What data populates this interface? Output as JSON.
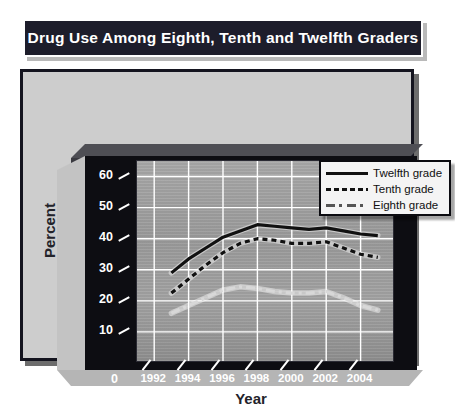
{
  "title": "Drug Use Among Eighth, Tenth and Twelfth Graders",
  "axis": {
    "ylabel": "Percent",
    "xlabel": "Year",
    "yticks": [
      "60",
      "50",
      "40",
      "30",
      "20",
      "10"
    ],
    "yzero": "0",
    "xticks": [
      "1992",
      "1994",
      "1996",
      "1998",
      "2000",
      "2002",
      "2004"
    ]
  },
  "legend": {
    "items": [
      {
        "label": "Twelfth grade",
        "style": "solid"
      },
      {
        "label": "Tenth grade",
        "style": "dashed"
      },
      {
        "label": "Eighth grade",
        "style": "dash-dot"
      }
    ]
  },
  "colors": {
    "title_bar": "#1d1d2b",
    "panel": "#cdcdcd",
    "axis_box": "#0d0d12",
    "plot_bg": "#9b9b9b",
    "gridline": "#ffffff",
    "twelfth": "#111111",
    "tenth": "#111111",
    "eighth": "#d8d8d8"
  },
  "chart_data": {
    "type": "line",
    "title": "Drug Use Among Eighth, Tenth and Twelfth Graders",
    "xlabel": "Year",
    "ylabel": "Percent",
    "xlim": [
      1991,
      2006
    ],
    "ylim": [
      0,
      65
    ],
    "yticks": [
      0,
      10,
      20,
      30,
      40,
      50,
      60
    ],
    "xticks": [
      1992,
      1994,
      1996,
      1998,
      2000,
      2002,
      2004
    ],
    "grid": true,
    "legend_position": "top-right",
    "x": [
      1993,
      1994,
      1995,
      1996,
      1997,
      1998,
      1999,
      2000,
      2001,
      2002,
      2003,
      2004,
      2005
    ],
    "series": [
      {
        "name": "Twelfth grade",
        "style": "solid",
        "values": [
          29.0,
          33.5,
          37.0,
          40.5,
          42.5,
          44.5,
          44.0,
          43.5,
          43.0,
          43.5,
          42.5,
          41.5,
          41.0
        ]
      },
      {
        "name": "Tenth grade",
        "style": "dashed",
        "values": [
          22.5,
          27.0,
          31.5,
          35.5,
          38.5,
          40.0,
          39.5,
          38.5,
          38.5,
          39.0,
          37.0,
          35.0,
          34.0
        ]
      },
      {
        "name": "Eighth grade",
        "style": "dash-dot",
        "values": [
          16.0,
          18.5,
          21.0,
          23.5,
          24.5,
          24.0,
          23.0,
          22.5,
          22.5,
          23.0,
          21.0,
          18.5,
          17.0
        ]
      }
    ]
  }
}
